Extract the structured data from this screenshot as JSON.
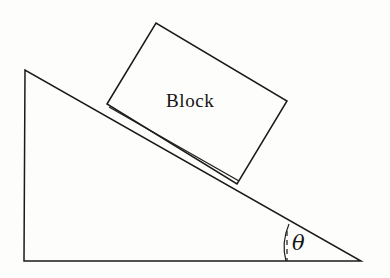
{
  "figure": {
    "type": "physics-diagram",
    "background_color": "#fdfdfc",
    "line_color": "#1a1a1a",
    "canvas": {
      "width": 390,
      "height": 278
    }
  },
  "labels": {
    "block": "Block",
    "angle": "θ"
  },
  "incline": {
    "name": "inclined-plane-triangle",
    "apex": {
      "x": 25,
      "y": 70
    },
    "bottom_left": {
      "x": 24,
      "y": 261
    },
    "bottom_right": {
      "x": 361,
      "y": 261
    },
    "angle_degrees": 29.6,
    "points": "25,70 24,261 361,261"
  },
  "block": {
    "name": "block-rectangle",
    "rotation_degrees": -31,
    "corners": [
      {
        "x": 107,
        "y": 104
      },
      {
        "x": 156,
        "y": 23
      },
      {
        "x": 287,
        "y": 101
      },
      {
        "x": 237,
        "y": 184
      }
    ],
    "points": "107,104 156,23 287,101 237,184"
  },
  "angle_marker": {
    "name": "theta-angle-marker",
    "vertex": {
      "x": 361,
      "y": 261
    },
    "arc_path": "M 289,224 Q 281,243 286,261",
    "reference_dash_path": "M 287,231 L 287,261",
    "label_position": {
      "x": 299,
      "y": 243
    }
  },
  "contact_line": {
    "name": "block-incline-contact",
    "path": "M 109,107 L 239,181"
  }
}
